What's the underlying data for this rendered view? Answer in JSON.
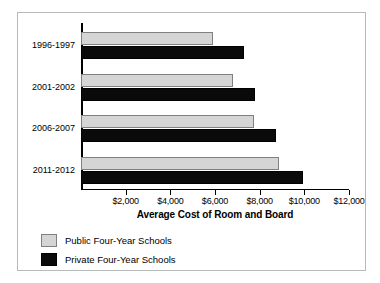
{
  "chart_data": {
    "type": "bar",
    "orientation": "horizontal",
    "title": "",
    "xlabel": "Average Cost of Room and Board",
    "ylabel": "",
    "categories": [
      "1996-1997",
      "2001-2002",
      "2006-2007",
      "2011-2012"
    ],
    "series": [
      {
        "name": "Public Four-Year Schools",
        "color": "#d5d5d5",
        "values": [
          5900,
          6800,
          7750,
          8850
        ]
      },
      {
        "name": "Private Four-Year Schools",
        "color": "#0a0a0a",
        "values": [
          7300,
          7800,
          8750,
          9950
        ]
      }
    ],
    "xlim": [
      0,
      12000
    ],
    "xticks": [
      2000,
      4000,
      6000,
      8000,
      10000,
      12000
    ],
    "xtick_labels": [
      "$2,000",
      "$4,000",
      "$6,000",
      "$8,000",
      "$10,000",
      "$12,000"
    ],
    "grid": false,
    "legend_position": "below"
  },
  "axis": {
    "x_title": "Average Cost of Room and Board"
  },
  "legend": {
    "items": [
      {
        "label": "Public Four-Year Schools"
      },
      {
        "label": "Private Four-Year Schools"
      }
    ]
  }
}
